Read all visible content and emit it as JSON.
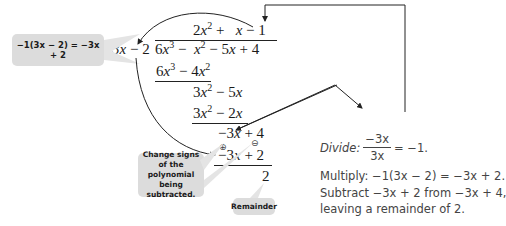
{
  "division": {
    "divisor": "3x − 2",
    "dividend": "6x³ − x² − 5x + 4",
    "quotient": "2x² + x − 1",
    "steps": [
      {
        "line": "6x³ − 4x²",
        "kind": "subtracted"
      },
      {
        "line": "3x² − 5x",
        "kind": "difference"
      },
      {
        "line": "3x² − 2x",
        "kind": "subtracted"
      },
      {
        "line": "−3x + 4",
        "kind": "difference"
      },
      {
        "line": "−3x + 2",
        "kind": "subtracted"
      },
      {
        "line": "2",
        "kind": "remainder"
      }
    ],
    "sign_markers": [
      "⊕",
      "⊖"
    ]
  },
  "callouts": {
    "multiply_note": "−1(3x − 2) = −3x + 2",
    "change_signs": "Change signs of the polynomial being subtracted.",
    "remainder": "Remainder"
  },
  "notes": {
    "divide_label": "Divide:",
    "divide_num": "−3x",
    "divide_den": "3x",
    "divide_result": "= −1.",
    "multiply": "Multiply: −1(3x − 2) = −3x + 2.",
    "subtract_line1": "Subtract −3x + 2 from −3x + 4,",
    "subtract_line2": "leaving a remainder of 2."
  },
  "colors": {
    "callout_bg": "#dcdcdc",
    "line": "#222222",
    "note_text": "#444444"
  }
}
